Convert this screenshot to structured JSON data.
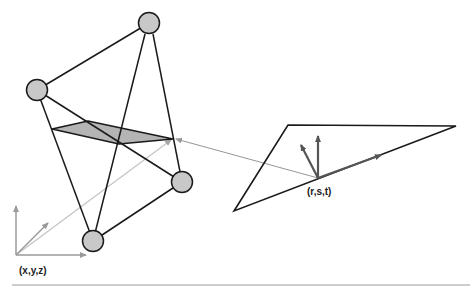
{
  "diagram": {
    "colors": {
      "edge": "#1a1a1a",
      "node_fill": "#c8c8c8",
      "node_stroke": "#1a1a1a",
      "slice_fill": "#b4b4b4",
      "arrow_dark": "#555555",
      "arrow_light": "#9a9a9a",
      "ray_light": "#c4c4c4",
      "divider": "#bdbdbd"
    },
    "tetrahedron": {
      "nodes": [
        {
          "id": "top",
          "x": 149,
          "y": 23
        },
        {
          "id": "left",
          "x": 37,
          "y": 90
        },
        {
          "id": "right",
          "x": 182,
          "y": 182
        },
        {
          "id": "bottom",
          "x": 93,
          "y": 241
        }
      ],
      "slice_polygon": "52,129 88,121 173,139 119,144"
    },
    "world_axes": {
      "label": "(x,y,z)",
      "origin": [
        16,
        255
      ]
    },
    "parametric_triangle": {
      "label": "(r,s,t)",
      "vertices": "288,125 456,126 234,211",
      "point": [
        318,
        178
      ]
    }
  }
}
